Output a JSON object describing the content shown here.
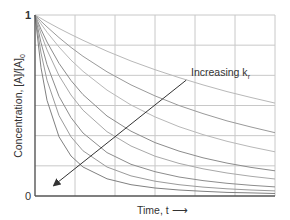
{
  "chart_data": {
    "type": "line",
    "title": "",
    "xlabel": "Time, t",
    "xlabel_arrow": "⟶",
    "ylabel": "Concentration, [A]/[A]0",
    "ylabel_parts": {
      "main": "Concentration, [A]/[A]",
      "sub": "0"
    },
    "ylim": [
      0,
      1
    ],
    "xlim": [
      0,
      1
    ],
    "y_ticks": [
      "0",
      "1"
    ],
    "x_ticks": [],
    "grid": true,
    "grid_columns": 6,
    "grid_rows": 6,
    "annotation": {
      "text": "Increasing k",
      "sub": "r",
      "arrow_from": [
        0.63,
        0.64
      ],
      "arrow_to": [
        0.08,
        0.06
      ]
    },
    "x": [
      0,
      0.025,
      0.05,
      0.1,
      0.15,
      0.2,
      0.3,
      0.4,
      0.5,
      0.6,
      0.7,
      0.8,
      0.9,
      1.0
    ],
    "series": [
      {
        "name": "k1",
        "color": "#b8b8b8",
        "values": [
          1,
          0.981,
          0.962,
          0.926,
          0.892,
          0.86,
          0.8,
          0.746,
          0.698,
          0.654,
          0.614,
          0.577,
          0.544,
          0.513
        ]
      },
      {
        "name": "k2",
        "color": "#9a9a9a",
        "values": [
          1,
          0.966,
          0.934,
          0.875,
          0.821,
          0.772,
          0.686,
          0.614,
          0.553,
          0.5,
          0.455,
          0.415,
          0.381,
          0.35
        ]
      },
      {
        "name": "k3",
        "color": "#b8b8b8",
        "values": [
          1,
          0.951,
          0.905,
          0.823,
          0.751,
          0.689,
          0.585,
          0.503,
          0.437,
          0.383,
          0.339,
          0.302,
          0.271,
          0.244
        ]
      },
      {
        "name": "k4",
        "color": "#8c8c8c",
        "values": [
          1,
          0.921,
          0.851,
          0.733,
          0.638,
          0.56,
          0.442,
          0.358,
          0.295,
          0.248,
          0.211,
          0.182,
          0.158,
          0.139
        ]
      },
      {
        "name": "k5",
        "color": "#a8a8a8",
        "values": [
          1,
          0.896,
          0.807,
          0.665,
          0.558,
          0.474,
          0.355,
          0.276,
          0.22,
          0.18,
          0.15,
          0.127,
          0.109,
          0.094
        ]
      },
      {
        "name": "k6",
        "color": "#8c8c8c",
        "values": [
          1,
          0.847,
          0.726,
          0.551,
          0.433,
          0.348,
          0.24,
          0.175,
          0.134,
          0.105,
          0.085,
          0.07,
          0.059,
          0.05
        ]
      },
      {
        "name": "k7",
        "color": "#9a9a9a",
        "values": [
          1,
          0.79,
          0.64,
          0.444,
          0.327,
          0.25,
          0.16,
          0.111,
          0.082,
          0.0625,
          0.049,
          0.04,
          0.033,
          0.028
        ]
      },
      {
        "name": "k8",
        "color": "#808080",
        "values": [
          1,
          0.709,
          0.529,
          0.327,
          0.221,
          0.16,
          0.095,
          0.0625,
          0.044,
          0.033,
          0.026,
          0.02,
          0.017,
          0.014
        ]
      }
    ]
  }
}
